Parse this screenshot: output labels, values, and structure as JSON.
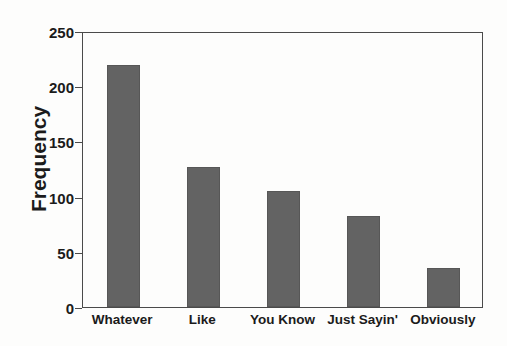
{
  "chart_data": {
    "type": "bar",
    "title": "",
    "xlabel": "",
    "ylabel": "Frequency",
    "categories": [
      "Whatever",
      "Like",
      "You Know",
      "Just Sayin'",
      "Obviously"
    ],
    "values": [
      219,
      127,
      105,
      82,
      35
    ],
    "ylim": [
      0,
      250
    ],
    "yticks": [
      0,
      50,
      100,
      150,
      200,
      250
    ],
    "ytick_labels": [
      "0",
      "50",
      "100",
      "150",
      "200",
      "250"
    ],
    "grid": false,
    "legend": false,
    "bar_color": "#636363",
    "axis_color": "#4a4a4a",
    "text_color": "#1b1b1b",
    "background": "#fdfdfc"
  }
}
